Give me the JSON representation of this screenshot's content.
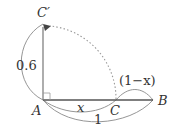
{
  "diagram": {
    "type": "geometry-rotation",
    "colors": {
      "segment": "#555555",
      "brace": "#8a8a8a",
      "dotted_arc": "#9a9a9a",
      "text": "#333333"
    },
    "points": {
      "A": {
        "label": "A"
      },
      "B": {
        "label": "B"
      },
      "C": {
        "label": "C"
      },
      "C_prime": {
        "label": "C′"
      }
    },
    "measures": {
      "AC_prime": "0.6",
      "AC": "x",
      "CB": "(1−x)",
      "AB": "1"
    },
    "elements": [
      {
        "kind": "segment",
        "from": "A",
        "to": "B"
      },
      {
        "kind": "segment",
        "from": "A",
        "to": "C′",
        "arrow": "end"
      },
      {
        "kind": "right-angle-marker",
        "at": "A"
      },
      {
        "kind": "dotted-arc",
        "from": "C",
        "to": "C′",
        "center": "A"
      },
      {
        "kind": "brace-arc",
        "span": "A–C′",
        "label": "0.6"
      },
      {
        "kind": "brace-arc",
        "span": "A–C",
        "label": "x"
      },
      {
        "kind": "brace-arc",
        "span": "C–B",
        "label": "(1−x)"
      },
      {
        "kind": "brace-arc",
        "span": "A–B",
        "label": "1"
      }
    ]
  }
}
